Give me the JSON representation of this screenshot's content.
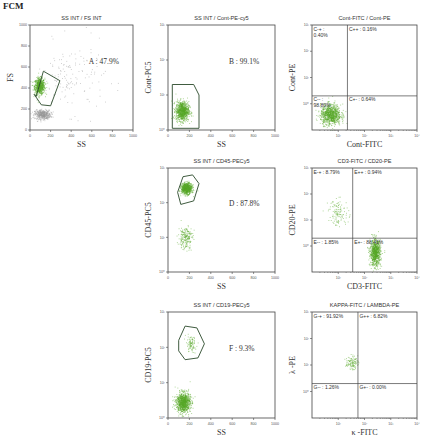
{
  "figure": {
    "title": "FCM"
  },
  "colors": {
    "events_primary": "#5aaa2a",
    "events_secondary": "#9a9a9a",
    "gate": "#2a4a2a",
    "axis": "#444444"
  },
  "chart_data": [
    {
      "id": "A",
      "type": "scatter",
      "title": "SS INT / FS INT",
      "xlabel": "SS",
      "ylabel": "FS",
      "xscale": "linear",
      "yscale": "linear",
      "xlim": [
        0,
        1000
      ],
      "ylim": [
        0,
        1000
      ],
      "xticks": [
        "0",
        "200",
        "400",
        "600",
        "800",
        "1000"
      ],
      "yticks": [
        "0",
        "200",
        "400",
        "600",
        "800",
        "1000"
      ],
      "gate": {
        "label": "A : 47.9%",
        "name": "A",
        "percent": 47.9,
        "polygon": [
          [
            60,
            320
          ],
          [
            130,
            560
          ],
          [
            290,
            470
          ],
          [
            200,
            230
          ],
          [
            110,
            240
          ],
          [
            40,
            340
          ]
        ]
      },
      "populations": [
        {
          "color": "green",
          "center": [
            90,
            420
          ],
          "spread": [
            45,
            70
          ],
          "count": 700
        },
        {
          "color": "gray",
          "center": [
            120,
            150
          ],
          "spread": [
            70,
            40
          ],
          "count": 450
        },
        {
          "color": "gray",
          "center": [
            400,
            500
          ],
          "spread": [
            300,
            300
          ],
          "count": 150
        }
      ]
    },
    {
      "id": "B",
      "type": "scatter",
      "title": "SS INT / Cont-PE-cy5",
      "xlabel": "SS",
      "ylabel": "Cont-PC5",
      "xscale": "linear",
      "yscale": "log",
      "xlim": [
        0,
        1000
      ],
      "ylim": [
        0,
        3
      ],
      "xticks": [
        "0",
        "200",
        "400",
        "600",
        "800",
        "1000"
      ],
      "yticks": [
        "10⁰",
        "10¹",
        "10²",
        "10³"
      ],
      "gate": {
        "label": "B : 99.1%",
        "name": "B",
        "percent": 99.1,
        "polygon": [
          [
            40,
            0.05
          ],
          [
            40,
            1.3
          ],
          [
            240,
            1.3
          ],
          [
            290,
            1.0
          ],
          [
            290,
            0.05
          ]
        ]
      },
      "populations": [
        {
          "color": "green",
          "center": [
            130,
            0.55
          ],
          "spread": [
            55,
            0.25
          ],
          "count": 900
        }
      ]
    },
    {
      "id": "C",
      "type": "scatter",
      "title": "Cont-FITC / Cont-PE",
      "xlabel": "Cont-FITC",
      "ylabel": "Cont-PE",
      "xscale": "log",
      "yscale": "log",
      "xlim": [
        0,
        4
      ],
      "ylim": [
        0,
        4
      ],
      "xticks": [
        "10¹",
        "10²",
        "10³",
        "10⁴"
      ],
      "yticks": [
        "10⁰",
        "10¹",
        "10²",
        "10³"
      ],
      "quadrant_split": [
        1.35,
        1.3
      ],
      "quadrants": [
        {
          "name": "C-+",
          "position": "top-left",
          "label": "C-+ :",
          "label2": "0.40%",
          "percent": 0.4
        },
        {
          "name": "C++",
          "position": "top-right",
          "label": "C++ : 0.16%",
          "percent": 0.16
        },
        {
          "name": "C--",
          "position": "bottom-left",
          "label": "C-- :",
          "label2": "98.80%",
          "percent": 98.8
        },
        {
          "name": "C+-",
          "position": "bottom-right",
          "label": "C+- : 0.64%",
          "percent": 0.64
        }
      ],
      "populations": [
        {
          "color": "green",
          "center": [
            0.7,
            0.6
          ],
          "spread": [
            0.35,
            0.35
          ],
          "count": 900
        }
      ]
    },
    {
      "id": "D",
      "type": "scatter",
      "title": "SS INT / CD45-PECy5",
      "xlabel": "SS",
      "ylabel": "CD45-PC5",
      "xscale": "linear",
      "yscale": "log",
      "xlim": [
        0,
        1000
      ],
      "ylim": [
        0,
        3
      ],
      "xticks": [
        "0",
        "200",
        "400",
        "600",
        "800",
        "1000"
      ],
      "yticks": [
        "10⁰",
        "10¹",
        "10²",
        "10³"
      ],
      "gate": {
        "label": "D : 87.8%",
        "name": "D",
        "percent": 87.8,
        "polygon": [
          [
            90,
            2.3
          ],
          [
            140,
            2.75
          ],
          [
            230,
            2.8
          ],
          [
            290,
            2.55
          ],
          [
            240,
            2.05
          ],
          [
            120,
            1.95
          ]
        ]
      },
      "populations": [
        {
          "color": "green",
          "center": [
            170,
            2.42
          ],
          "spread": [
            45,
            0.14
          ],
          "count": 800
        },
        {
          "color": "green",
          "center": [
            160,
            1.0
          ],
          "spread": [
            60,
            0.3
          ],
          "count": 200
        }
      ]
    },
    {
      "id": "E",
      "type": "scatter",
      "title": "CD3-FITC / CD20-PE",
      "xlabel": "CD3-FITC",
      "ylabel": "CD20-PE",
      "xscale": "log",
      "yscale": "log",
      "xlim": [
        0,
        4
      ],
      "ylim": [
        0,
        4
      ],
      "xticks": [
        "10¹",
        "10²",
        "10³",
        "10⁴"
      ],
      "yticks": [
        "10⁰",
        "10¹",
        "10²",
        "10³"
      ],
      "quadrant_split": [
        1.55,
        1.3
      ],
      "quadrants": [
        {
          "name": "E-+",
          "position": "top-left",
          "label": "E-+ : 8.79%",
          "percent": 8.79
        },
        {
          "name": "E++",
          "position": "top-right",
          "label": "E++ : 0.94%",
          "percent": 0.94
        },
        {
          "name": "E--",
          "position": "bottom-left",
          "label": "E-- : 1.85%",
          "percent": 1.85
        },
        {
          "name": "E+-",
          "position": "bottom-right",
          "label": "E+- : 88.41%",
          "percent": 88.41
        }
      ],
      "populations": [
        {
          "color": "green",
          "center": [
            2.4,
            0.75
          ],
          "spread": [
            0.18,
            0.45
          ],
          "count": 850
        },
        {
          "color": "green",
          "center": [
            1.0,
            2.3
          ],
          "spread": [
            0.35,
            0.45
          ],
          "count": 120
        }
      ]
    },
    {
      "id": "F",
      "type": "scatter",
      "title": "SS INT / CD19-PECy5",
      "xlabel": "SS",
      "ylabel": "CD19-PC5",
      "xscale": "linear",
      "yscale": "log",
      "xlim": [
        0,
        1000
      ],
      "ylim": [
        0,
        3
      ],
      "xticks": [
        "0",
        "200",
        "400",
        "600",
        "800",
        "1000"
      ],
      "yticks": [
        "10⁰",
        "10¹",
        "10²",
        "10³"
      ],
      "gate": {
        "label": "F : 9.3%",
        "name": "F",
        "percent": 9.3,
        "polygon": [
          [
            100,
            2.2
          ],
          [
            160,
            2.6
          ],
          [
            270,
            2.55
          ],
          [
            340,
            2.1
          ],
          [
            280,
            1.7
          ],
          [
            160,
            1.65
          ],
          [
            100,
            1.9
          ]
        ]
      },
      "populations": [
        {
          "color": "green",
          "center": [
            140,
            0.45
          ],
          "spread": [
            60,
            0.25
          ],
          "count": 950
        },
        {
          "color": "green",
          "center": [
            210,
            2.1
          ],
          "spread": [
            45,
            0.2
          ],
          "count": 90
        }
      ]
    },
    {
      "id": "G",
      "type": "scatter",
      "title": "KAPPA-FITC / LAMBDA-PE",
      "xlabel": "κ -FITC",
      "ylabel": "λ -PE",
      "xscale": "log",
      "yscale": "log",
      "xlim": [
        0,
        4
      ],
      "ylim": [
        0,
        4
      ],
      "xticks": [
        "10¹",
        "10²",
        "10³",
        "10⁴"
      ],
      "yticks": [
        "10⁰",
        "10¹",
        "10²",
        "10³"
      ],
      "quadrant_split": [
        1.75,
        1.3
      ],
      "quadrants": [
        {
          "name": "G-+",
          "position": "top-left",
          "label": "G-+ : 91.92%",
          "percent": 91.92
        },
        {
          "name": "G++",
          "position": "top-right",
          "label": "G++ : 6.82%",
          "percent": 6.82
        },
        {
          "name": "G--",
          "position": "bottom-left",
          "label": "G-- : 1.26%",
          "percent": 1.26
        },
        {
          "name": "G+-",
          "position": "bottom-right",
          "label": "G+- : 0.00%",
          "percent": 0.0
        }
      ],
      "populations": [
        {
          "color": "green",
          "center": [
            1.5,
            2.1
          ],
          "spread": [
            0.2,
            0.22
          ],
          "count": 110
        }
      ]
    }
  ]
}
